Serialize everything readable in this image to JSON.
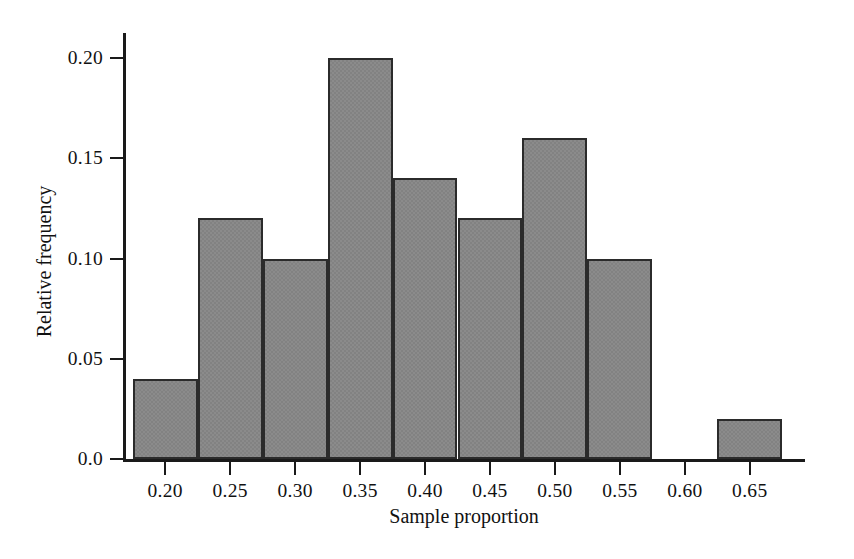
{
  "chart_data": {
    "type": "bar",
    "title": "",
    "subtitle": "",
    "xlabel": "Sample proportion",
    "ylabel": "Relative frequency",
    "xlim": [
      0.1675,
      0.6925
    ],
    "ylim": [
      0.0,
      0.2125
    ],
    "grid": false,
    "legend": null,
    "bin_width": 0.05,
    "x_ticks": [
      0.2,
      0.25,
      0.3,
      0.35,
      0.4,
      0.45,
      0.5,
      0.55,
      0.6,
      0.65
    ],
    "x_tick_labels": [
      "0.20",
      "0.25",
      "0.30",
      "0.35",
      "0.40",
      "0.45",
      "0.50",
      "0.55",
      "0.60",
      "0.65"
    ],
    "y_ticks": [
      0.0,
      0.05,
      0.1,
      0.15,
      0.2
    ],
    "y_tick_labels": [
      "0.0",
      "0.05",
      "0.10",
      "0.15",
      "0.20"
    ],
    "bar_fill_color": "#828282",
    "bar_edge_color": "#2b2b2b",
    "axis_color": "#1a1a1a",
    "background_color": "#ffffff",
    "bins": [
      {
        "bin_start": 0.175,
        "bin_end": 0.225,
        "center": 0.2,
        "value": 0.04
      },
      {
        "bin_start": 0.225,
        "bin_end": 0.275,
        "center": 0.25,
        "value": 0.12
      },
      {
        "bin_start": 0.275,
        "bin_end": 0.325,
        "center": 0.3,
        "value": 0.1
      },
      {
        "bin_start": 0.325,
        "bin_end": 0.375,
        "center": 0.35,
        "value": 0.2
      },
      {
        "bin_start": 0.375,
        "bin_end": 0.425,
        "center": 0.4,
        "value": 0.14
      },
      {
        "bin_start": 0.425,
        "bin_end": 0.475,
        "center": 0.45,
        "value": 0.12
      },
      {
        "bin_start": 0.475,
        "bin_end": 0.525,
        "center": 0.5,
        "value": 0.16
      },
      {
        "bin_start": 0.525,
        "bin_end": 0.575,
        "center": 0.55,
        "value": 0.1
      },
      {
        "bin_start": 0.575,
        "bin_end": 0.625,
        "center": 0.6,
        "value": 0.0
      },
      {
        "bin_start": 0.625,
        "bin_end": 0.675,
        "center": 0.65,
        "value": 0.02
      }
    ],
    "categories": [
      "0.175-0.225",
      "0.225-0.275",
      "0.275-0.325",
      "0.325-0.375",
      "0.375-0.425",
      "0.425-0.475",
      "0.475-0.525",
      "0.525-0.575",
      "0.575-0.625",
      "0.625-0.675"
    ],
    "values": [
      0.04,
      0.12,
      0.1,
      0.2,
      0.14,
      0.12,
      0.16,
      0.1,
      0.0,
      0.02
    ]
  }
}
